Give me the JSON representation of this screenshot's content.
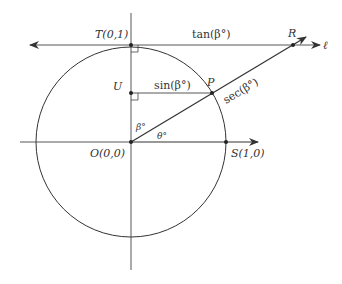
{
  "diagram": {
    "type": "unit-circle-trig-diagram",
    "colors": {
      "stroke": "#333333",
      "background": "#ffffff"
    },
    "points": {
      "T": {
        "label": "T(0,1)"
      },
      "U": {
        "label": "U"
      },
      "P": {
        "label": "P"
      },
      "R": {
        "label": "R"
      },
      "O": {
        "label": "O(0,0)"
      },
      "S": {
        "label": "S(1,0)"
      }
    },
    "segment_labels": {
      "tan": "tan(β°)",
      "sin": "sin(β°)",
      "sec": "sec(β°)"
    },
    "angle_labels": {
      "beta": "β°",
      "theta": "θ°"
    },
    "line_label": "ℓ"
  }
}
